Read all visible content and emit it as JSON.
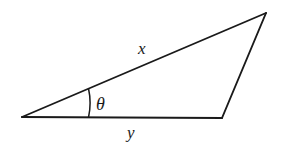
{
  "figure": {
    "background_color": "#ffffff",
    "stroke_color": "#1a1a1a",
    "stroke_width": 1.8,
    "width": 281,
    "height": 148,
    "vertices": {
      "left_apex": {
        "name": "left-apex",
        "x": 22,
        "y": 117
      },
      "top_right": {
        "name": "top-right-vertex",
        "x": 266,
        "y": 13
      },
      "bottom_right": {
        "name": "bottom-right-vertex",
        "x": 222,
        "y": 118
      }
    },
    "edges": [
      {
        "name": "side-x-hypotenuse",
        "from": "left_apex",
        "to": "top_right",
        "label": "x"
      },
      {
        "name": "side-right",
        "from": "top_right",
        "to": "bottom_right",
        "label": ""
      },
      {
        "name": "side-y-base",
        "from": "bottom_right",
        "to": "left_apex",
        "label": "y"
      }
    ],
    "angle_arc": {
      "name": "angle-theta-arc",
      "at_vertex": "left_apex",
      "radius": 66,
      "path": "M 88 89 A 66 66 0 0 1 88 117",
      "label": "θ"
    },
    "labels": {
      "side_x": {
        "text": "x",
        "x": 143,
        "y": 54
      },
      "side_y": {
        "text": "y",
        "x": 133,
        "y": 138
      },
      "angle_theta": {
        "text": "θ",
        "x": 96,
        "y": 110
      }
    }
  }
}
